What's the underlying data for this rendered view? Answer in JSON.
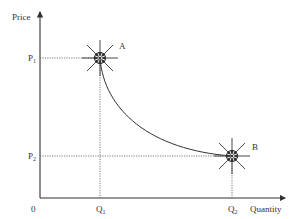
{
  "diagram": {
    "type": "price-quantity adjustment diagram",
    "axes": {
      "y_label": "Price",
      "x_label": "Quantity",
      "origin_label": "0"
    },
    "ticks": {
      "p1": {
        "main": "P",
        "sub": "1"
      },
      "p2": {
        "main": "P",
        "sub": "2"
      },
      "q1": {
        "main": "Q",
        "sub": "1"
      },
      "q2": {
        "main": "Q",
        "sub": "2"
      }
    },
    "points": [
      {
        "id": "A",
        "label": "A",
        "x": 100,
        "y": 58,
        "description": "stable equilibrium at (Q1, P1)"
      },
      {
        "id": "B",
        "label": "B",
        "x": 232,
        "y": 156,
        "description": "stable equilibrium at (Q2, P2)"
      }
    ],
    "curve": {
      "description": "convex downward-sloping curve from A to B"
    },
    "colors": {
      "line": "#333333",
      "guide": "#555555",
      "background": "#ffffff"
    }
  }
}
